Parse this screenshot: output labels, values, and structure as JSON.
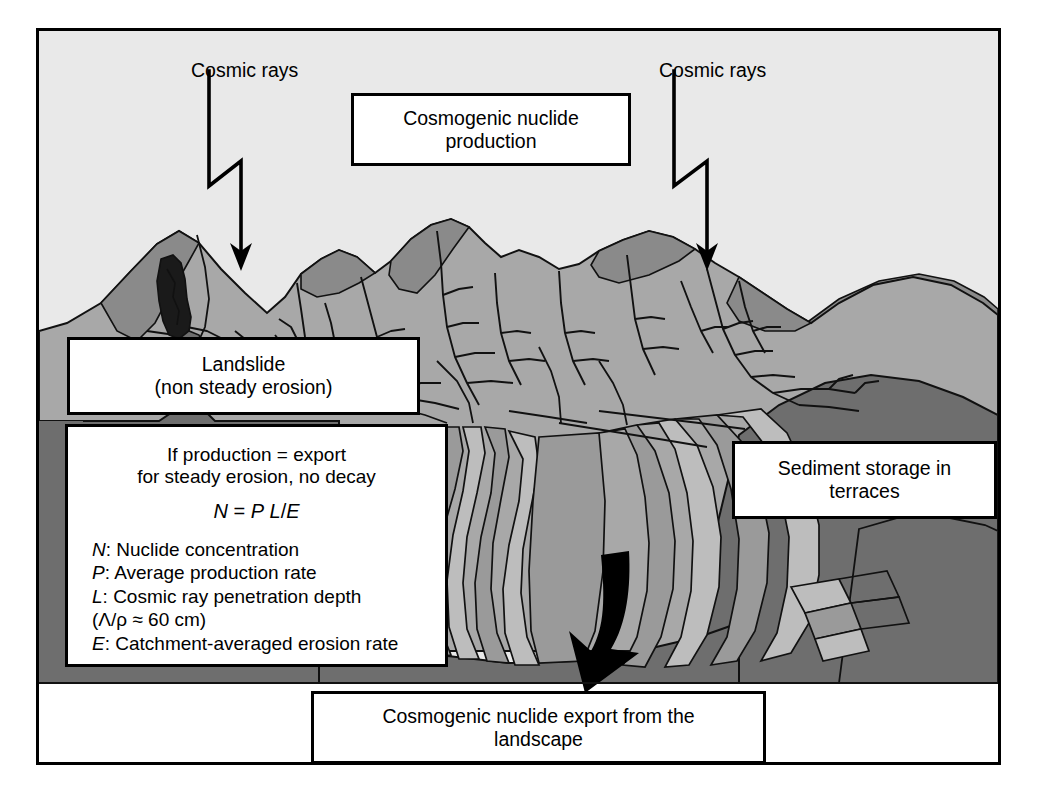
{
  "figure": {
    "domain": "diagram",
    "title_text": null,
    "background": "#ffffff",
    "frame_border_color": "#000000"
  },
  "labels": {
    "cosmic_rays_left": "Cosmic rays",
    "cosmic_rays_right": "Cosmic rays",
    "production_line1": "Cosmogenic nuclide",
    "production_line2": "production",
    "landslide_line1": "Landslide",
    "landslide_line2": "(non steady erosion)",
    "terraces_line1": "Sediment storage in",
    "terraces_line2": "terraces",
    "export_line1": "Cosmogenic nuclide export from the",
    "export_line2": "landscape"
  },
  "equation_box": {
    "condition_line1": "If production = export",
    "condition_line2": "for steady erosion, no decay",
    "formula": "N = P L/E",
    "formula_parts": {
      "lhs": "N",
      "eq": " = ",
      "p": "P",
      "space": " ",
      "l": "L",
      "slash": "/",
      "e": "E"
    },
    "definitions": [
      {
        "symbol": "N",
        "text": ": Nuclide concentration"
      },
      {
        "symbol": "P",
        "text": ": Average production rate"
      },
      {
        "symbol": "L",
        "text": ": Cosmic ray penetration depth"
      },
      {
        "symbol": "",
        "text": "(Λ/ρ ≈ 60 cm)"
      },
      {
        "symbol": "E",
        "text": ": Catchment-averaged erosion rate"
      }
    ]
  },
  "scene": {
    "sky_color": "#e9e9e9",
    "mountain_light": "#a8a8a8",
    "mountain_shadow": "#8a8a8a",
    "foreground_dark": "#6e6e6e",
    "terrace_light": "#bdbdbd",
    "terrace_mid": "#9a9a9a",
    "landslide_color": "#1a1a1a",
    "outline_color": "#111111",
    "arrow_color": "#000000",
    "elements": [
      "cosmic-ray-zigzag-left",
      "cosmic-ray-zigzag-right",
      "mountain-ridgeline",
      "drainage-network",
      "landslide-scar",
      "river-terraces",
      "sediment-export-arrow"
    ]
  }
}
